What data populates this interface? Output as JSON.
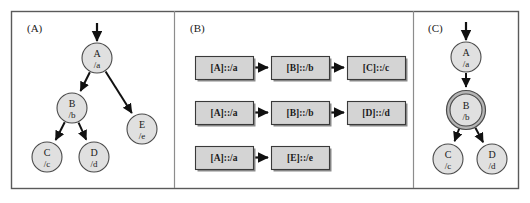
{
  "figure": {
    "background_color": "#ffffff",
    "border_color": "#5a5a5a",
    "separator_color": "#8c8c8c",
    "node_fill": "#e0e0e0",
    "node_stroke": "#4a4a4a",
    "highlight_ring_fill": "#b5b5b5",
    "highlight_ring_stroke": "#4a4a4a",
    "box_fill": "#d4d4d4",
    "box_stroke": "#3a3a3a",
    "box_shadow": "#8a8a8a",
    "arrow_color": "#111111",
    "text_color": "#1a1a1a"
  },
  "panels": [
    {
      "id": "panel-a",
      "label": "(A)",
      "label_x": 27,
      "label_y": 32,
      "type": "tree",
      "nodes": [
        {
          "id": "a",
          "name": "A",
          "path": "/a",
          "cx": 97,
          "cy": 58,
          "r": 15,
          "highlight": false
        },
        {
          "id": "b",
          "name": "B",
          "path": "/b",
          "cx": 72,
          "cy": 108,
          "r": 15,
          "highlight": false
        },
        {
          "id": "e",
          "name": "E",
          "path": "/e",
          "cx": 142,
          "cy": 129,
          "r": 15,
          "highlight": false
        },
        {
          "id": "c",
          "name": "C",
          "path": "/c",
          "cx": 47,
          "cy": 157,
          "r": 15,
          "highlight": false
        },
        {
          "id": "d",
          "name": "D",
          "path": "/d",
          "cx": 94,
          "cy": 157,
          "r": 15,
          "highlight": false
        }
      ],
      "entry_arrow": {
        "x1": 97,
        "y1": 23,
        "x2": 97,
        "y2": 41
      },
      "edges": [
        {
          "from": "a",
          "to": "b"
        },
        {
          "from": "a",
          "to": "e"
        },
        {
          "from": "b",
          "to": "c"
        },
        {
          "from": "b",
          "to": "d"
        }
      ]
    },
    {
      "id": "panel-b",
      "label": "(B)",
      "label_x": 190,
      "label_y": 32,
      "type": "chains",
      "chains": [
        {
          "id": "chain-1",
          "y": 56,
          "steps": [
            {
              "id": "b1s1",
              "label": "[A]::/a",
              "x": 195,
              "w": 58
            },
            {
              "id": "b1s2",
              "label": "[B]::/b",
              "x": 271,
              "w": 58
            },
            {
              "id": "b1s3",
              "label": "[C]::/c",
              "x": 347,
              "w": 58
            }
          ]
        },
        {
          "id": "chain-2",
          "y": 101,
          "steps": [
            {
              "id": "b2s1",
              "label": "[A]::/a",
              "x": 195,
              "w": 58
            },
            {
              "id": "b2s2",
              "label": "[B]::/b",
              "x": 271,
              "w": 58
            },
            {
              "id": "b2s3",
              "label": "[D]::/d",
              "x": 347,
              "w": 58
            }
          ]
        },
        {
          "id": "chain-3",
          "y": 146,
          "steps": [
            {
              "id": "b3s1",
              "label": "[A]::/a",
              "x": 195,
              "w": 58
            },
            {
              "id": "b3s2",
              "label": "[E]::/e",
              "x": 271,
              "w": 58
            }
          ]
        }
      ],
      "box_height": 23
    },
    {
      "id": "panel-c",
      "label": "(C)",
      "label_x": 428,
      "label_y": 32,
      "type": "tree",
      "nodes": [
        {
          "id": "a",
          "name": "A",
          "path": "/a",
          "cx": 466,
          "cy": 57,
          "r": 15,
          "highlight": false
        },
        {
          "id": "b",
          "name": "B",
          "path": "/b",
          "cx": 466,
          "cy": 110,
          "r": 16,
          "highlight": true
        },
        {
          "id": "c",
          "name": "C",
          "path": "/c",
          "cx": 448,
          "cy": 159,
          "r": 15,
          "highlight": false
        },
        {
          "id": "d",
          "name": "D",
          "path": "/d",
          "cx": 492,
          "cy": 159,
          "r": 15,
          "highlight": false
        }
      ],
      "entry_arrow": {
        "x1": 466,
        "y1": 22,
        "x2": 466,
        "y2": 40
      },
      "edges": [
        {
          "from": "a",
          "to": "b"
        },
        {
          "from": "b",
          "to": "c"
        },
        {
          "from": "b",
          "to": "d"
        }
      ]
    }
  ],
  "frame": {
    "x": 11,
    "y": 11,
    "width": 507,
    "height": 177,
    "separators": [
      174,
      413
    ]
  }
}
